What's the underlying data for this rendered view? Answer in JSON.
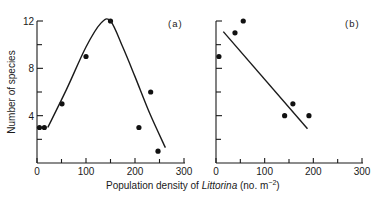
{
  "chart_data": [
    {
      "type": "scatter",
      "panel_label": "(a)",
      "title": "",
      "xlabel": "Population density of Littorina (no. m^-2)",
      "ylabel": "Number of species",
      "xlim": [
        0,
        300
      ],
      "ylim": [
        0,
        12
      ],
      "x_ticks": [
        0,
        100,
        200,
        300
      ],
      "x_minor_ticks": [
        50,
        150,
        250
      ],
      "y_ticks": [
        4,
        8,
        12
      ],
      "y_minor_ticks": [
        2,
        6,
        10
      ],
      "grid": false,
      "series": [
        {
          "name": "observations",
          "points": [
            [
              5,
              3
            ],
            [
              15,
              3
            ],
            [
              51,
              5
            ],
            [
              100,
              9
            ],
            [
              150,
              12
            ],
            [
              208,
              3
            ],
            [
              232,
              6
            ],
            [
              247,
              1
            ]
          ]
        },
        {
          "name": "fitted curve (hump-shaped)",
          "kind": "line",
          "points": [
            [
              22,
              3
            ],
            [
              60,
              6.2
            ],
            [
              100,
              9.8
            ],
            [
              130,
              11.8
            ],
            [
              150,
              12
            ],
            [
              175,
              9.8
            ],
            [
              200,
              7.3
            ],
            [
              230,
              4.2
            ],
            [
              262,
              1.3
            ]
          ]
        }
      ]
    },
    {
      "type": "scatter",
      "panel_label": "(b)",
      "title": "",
      "xlabel": "Population density of Littorina (no. m^-2)",
      "ylabel": "Number of species",
      "xlim": [
        0,
        300
      ],
      "ylim": [
        0,
        12
      ],
      "x_ticks": [
        0,
        100,
        200,
        300
      ],
      "x_minor_ticks": [
        50,
        150,
        250
      ],
      "y_ticks": [
        4,
        8,
        12
      ],
      "y_minor_ticks": [
        2,
        6,
        10
      ],
      "grid": false,
      "series": [
        {
          "name": "observations",
          "points": [
            [
              6,
              9
            ],
            [
              39,
              11
            ],
            [
              56,
              12
            ],
            [
              141,
              4
            ],
            [
              158,
              5
            ],
            [
              191,
              4
            ]
          ]
        },
        {
          "name": "fitted regression line",
          "kind": "line",
          "points": [
            [
              15,
              11.1
            ],
            [
              188,
              2.9
            ]
          ]
        }
      ]
    }
  ],
  "labels": {
    "panel_a": "(a)",
    "panel_b": "(b)",
    "ylabel": "Number of species",
    "xlabel_prefix": "Population density of ",
    "xlabel_italic": "Littorina",
    "xlabel_suffix": " (no. m",
    "xlabel_exp": "−2",
    "xlabel_close": ")",
    "x_tick_labels": [
      "0",
      "100",
      "200",
      "300"
    ],
    "y_tick_labels": [
      "4",
      "8",
      "12"
    ]
  }
}
